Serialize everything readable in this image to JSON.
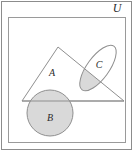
{
  "figure": {
    "universe_label": "U",
    "labels": {
      "universe": "U",
      "triangle": "A",
      "circle": "B",
      "ellipse": "C"
    },
    "colors": {
      "outer_border": "#8c8c8c",
      "inner_border": "#9a9a9a",
      "shape_stroke": "#8f8f8f",
      "shade_fill": "#d9d9d9",
      "page_background": "#ffffff",
      "label_text": "#2b2b2b"
    },
    "shapes": [
      {
        "name": "universe-rectangle",
        "label": "U",
        "type": "rectangle",
        "x": 8,
        "y": 17,
        "width": 117,
        "height": 125,
        "filled": false
      },
      {
        "name": "set-a-triangle",
        "label": "A",
        "type": "triangle",
        "points": "58,47 22,101 124,101",
        "filled": false,
        "label_x": 52,
        "label_y": 76
      },
      {
        "name": "set-b-circle",
        "label": "B",
        "type": "circle",
        "cx": 50,
        "cy": 113,
        "r": 23,
        "filled": true,
        "label_x": 50,
        "label_y": 121
      },
      {
        "name": "set-c-ellipse",
        "label": "C",
        "type": "ellipse",
        "cx": 98,
        "cy": 68,
        "rx": 11,
        "ry": 27,
        "rotation_deg": 36,
        "filled": false,
        "label_x": 99,
        "label_y": 68
      },
      {
        "name": "a-intersect-c-region",
        "label": "",
        "type": "shaded-intersection",
        "filled": true
      }
    ]
  }
}
